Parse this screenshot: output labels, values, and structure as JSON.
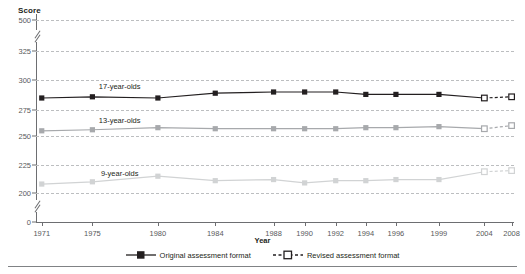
{
  "chart_data": {
    "type": "line",
    "title": "",
    "xlabel": "Year",
    "ylabel": "Score",
    "grid": true,
    "legend_position": "bottom",
    "categories": [
      1971,
      1975,
      1980,
      1984,
      1988,
      1990,
      1992,
      1994,
      1996,
      1999,
      2004,
      2008
    ],
    "x_tick_labels": [
      "1971",
      "1975",
      "1980",
      "1984",
      "1988",
      "1990",
      "1992",
      "1994",
      "1996",
      "1999",
      "2004",
      "2008"
    ],
    "y_tick_labels": [
      "500",
      "325",
      "300",
      "275",
      "250",
      "225",
      "200",
      "0"
    ],
    "y_tick_values": [
      500,
      325,
      300,
      275,
      250,
      225,
      200,
      0
    ],
    "ylim": [
      0,
      500
    ],
    "axis_breaks": [
      {
        "between": [
          325,
          500
        ]
      },
      {
        "between": [
          0,
          200
        ]
      }
    ],
    "series": [
      {
        "name": "17-year-olds",
        "label": "17-year-olds",
        "color": "#231f20",
        "format_original": {
          "x": [
            1971,
            1975,
            1980,
            1984,
            1988,
            1990,
            1992,
            1994,
            1996,
            1999,
            2004
          ],
          "values": [
            285,
            286,
            285,
            289,
            290,
            290,
            290,
            288,
            288,
            288,
            285
          ]
        },
        "format_revised": {
          "x": [
            2004,
            2008
          ],
          "values": [
            285,
            286
          ]
        }
      },
      {
        "name": "13-year-olds",
        "label": "13-year-olds",
        "color": "#a7a9ac",
        "format_original": {
          "x": [
            1971,
            1975,
            1980,
            1984,
            1988,
            1990,
            1992,
            1994,
            1996,
            1999,
            2004
          ],
          "values": [
            255,
            256,
            258,
            257,
            257,
            257,
            257,
            258,
            258,
            259,
            257
          ]
        },
        "format_revised": {
          "x": [
            2004,
            2008
          ],
          "values": [
            257,
            260
          ]
        }
      },
      {
        "name": "9-year-olds",
        "label": "9-year-olds",
        "color": "#d1d3d4",
        "format_original": {
          "x": [
            1971,
            1975,
            1980,
            1984,
            1988,
            1990,
            1992,
            1994,
            1996,
            1999,
            2004
          ],
          "values": [
            208,
            210,
            215,
            211,
            212,
            209,
            211,
            211,
            212,
            212,
            219
          ]
        },
        "format_revised": {
          "x": [
            2004,
            2008
          ],
          "values": [
            219,
            220
          ]
        }
      }
    ],
    "legend": [
      {
        "label": "Original assessment format",
        "style": "solid",
        "marker": "filled-square",
        "color": "#231f20"
      },
      {
        "label": "Revised assessment format",
        "style": "dashed",
        "marker": "open-square",
        "color": "#231f20"
      }
    ]
  },
  "axes": {
    "y_title": "Score",
    "x_title": "Year"
  }
}
